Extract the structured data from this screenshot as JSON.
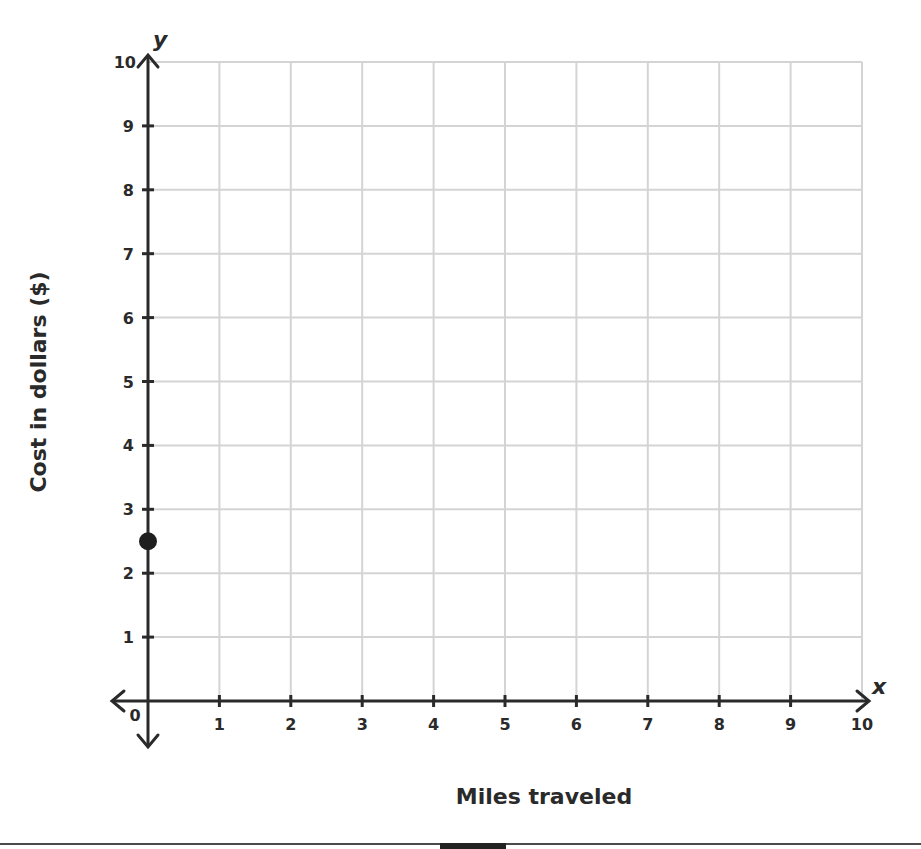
{
  "chart_data": {
    "type": "scatter",
    "title": "",
    "xlabel": "Miles traveled",
    "ylabel": "Cost in dollars ($)",
    "x_var": "x",
    "y_var": "y",
    "xlim": [
      0,
      10
    ],
    "ylim": [
      0,
      10
    ],
    "x_ticks": [
      0,
      1,
      2,
      3,
      4,
      5,
      6,
      7,
      8,
      9,
      10
    ],
    "y_ticks": [
      1,
      2,
      3,
      4,
      5,
      6,
      7,
      8,
      9,
      10
    ],
    "origin_label": "0",
    "grid": true,
    "series": [
      {
        "name": "point",
        "points": [
          {
            "x": 0,
            "y": 2.5
          }
        ]
      }
    ]
  },
  "colors": {
    "grid": "#d4d4d4",
    "axis": "#2a2a2a",
    "point": "#1e1e1e"
  }
}
